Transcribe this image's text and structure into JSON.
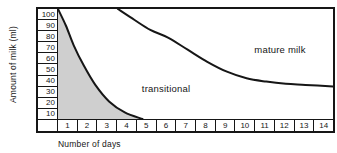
{
  "figure": {
    "y_axis_title": "Amount of milk (ml)",
    "x_axis_title": "Number of days"
  },
  "chart_data": {
    "type": "area",
    "title": "",
    "xlabel": "Number of days",
    "ylabel": "Amount of milk (ml)",
    "xlim": [
      0.5,
      14.5
    ],
    "ylim": [
      0,
      100
    ],
    "x_ticks": [
      "1",
      "2",
      "3",
      "4",
      "5",
      "6",
      "7",
      "8",
      "9",
      "10",
      "11",
      "12",
      "13",
      "14"
    ],
    "y_ticks": [
      "100",
      "90",
      "80",
      "70",
      "60",
      "50",
      "40",
      "30",
      "20",
      "10"
    ],
    "grid": false,
    "legend": false,
    "colors": {
      "line": "#161616",
      "area_fill": "#cfcfcf",
      "background": "#ffffff"
    },
    "series": [
      {
        "name": "colostrum-shaded-boundary",
        "type": "area",
        "points": [
          [
            0.5,
            100
          ],
          [
            0.9,
            85
          ],
          [
            1.3,
            67
          ],
          [
            1.8,
            49
          ],
          [
            2.4,
            31
          ],
          [
            3.1,
            16
          ],
          [
            3.9,
            6
          ],
          [
            4.8,
            0
          ]
        ]
      },
      {
        "name": "transitional-mature-boundary",
        "type": "line",
        "points": [
          [
            3.55,
            100
          ],
          [
            4.4,
            90
          ],
          [
            5.2,
            81
          ],
          [
            6.1,
            74
          ],
          [
            7.1,
            63
          ],
          [
            8.1,
            52
          ],
          [
            9.1,
            43
          ],
          [
            10.1,
            37
          ],
          [
            11.1,
            34
          ],
          [
            12.1,
            32
          ],
          [
            13.1,
            31
          ],
          [
            14.5,
            29.5
          ]
        ]
      }
    ],
    "annotations": [
      {
        "text": "transitional",
        "x": 6.0,
        "y": 28
      },
      {
        "text": "mature milk",
        "x": 11.8,
        "y": 64
      }
    ]
  }
}
